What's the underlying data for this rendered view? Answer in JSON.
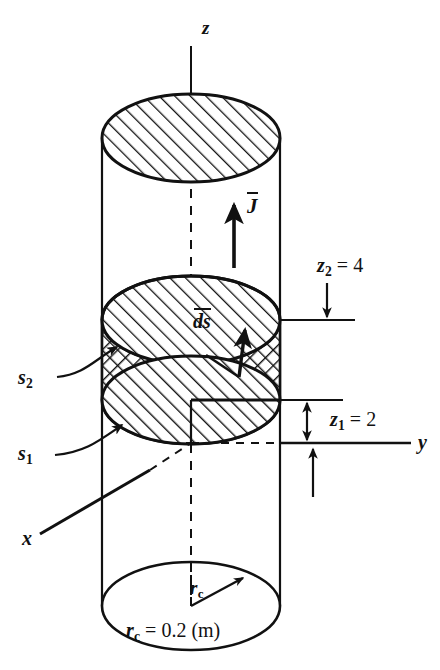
{
  "figure": {
    "background_color": "#ffffff",
    "ink_color": "#111111"
  },
  "axes": {
    "z": {
      "label": "z",
      "orientation": "vertical-up"
    },
    "y": {
      "label": "y",
      "orientation": "horizontal-right"
    },
    "x": {
      "label": "x",
      "orientation": "diagonal-toward-viewer"
    }
  },
  "vectors": {
    "current_density": {
      "label": "J",
      "overbar": true,
      "direction": "up-along-z"
    },
    "surface_element": {
      "label": "ds",
      "overbar": true,
      "direction": "normal-to-disk"
    }
  },
  "surfaces": {
    "s2": {
      "label": "s",
      "subscript": "2",
      "description": "upper hatched cross-section at z2"
    },
    "s1": {
      "label": "s",
      "subscript": "1",
      "description": "lower hatched cross-section at z1"
    }
  },
  "dimensions": {
    "z2": {
      "symbol": "z",
      "subscript": "2",
      "equals": "= 4",
      "value": 4,
      "full": "z2 = 4"
    },
    "z1": {
      "symbol": "z",
      "subscript": "1",
      "equals": "= 2",
      "value": 2,
      "full": "z1 = 2"
    },
    "rc_short": {
      "symbol": "r",
      "subscript": "c"
    },
    "rc_value": {
      "symbol": "r",
      "subscript": "c",
      "equals": "= 0.2 (m)",
      "value": 0.2,
      "unit": "m",
      "full": "rc = 0.2 (m)"
    }
  },
  "geometry": {
    "cylinder_left_x": 102,
    "cylinder_right_x": 280,
    "center_x": 191,
    "top_ellipse_cy": 138,
    "s2_ellipse_cy": 320,
    "s1_ellipse_cy": 400,
    "bottom_ellipse_cy": 606,
    "ellipse_rx": 89,
    "ellipse_ry": 44,
    "hatch_angle_deg": 45,
    "crosshatch": true
  }
}
